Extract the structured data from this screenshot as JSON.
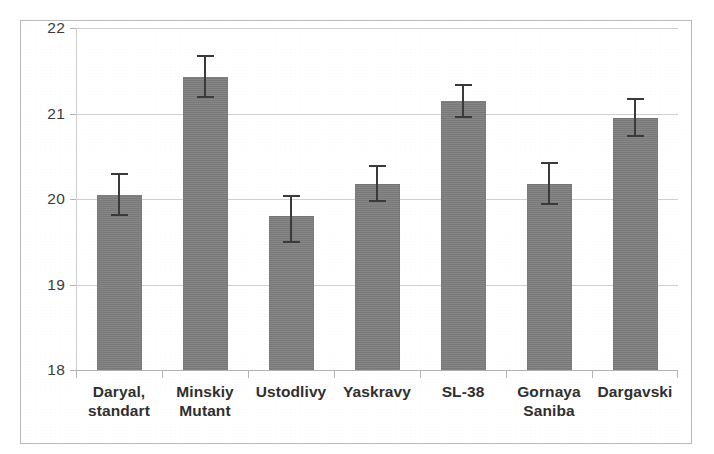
{
  "chart_data": {
    "type": "bar",
    "title": "",
    "subtitle": "",
    "xlabel": "",
    "ylabel": "",
    "categories": [
      "Daryal,\nstandart",
      "Minskiy\nMutant",
      "Ustodlivy",
      "Yaskravy",
      "SL-38",
      "Gornaya\nSaniba",
      "Dargavski"
    ],
    "values": [
      20.05,
      21.43,
      19.8,
      20.18,
      21.15,
      20.18,
      20.95
    ],
    "errors_upper": [
      0.25,
      0.25,
      0.25,
      0.22,
      0.2,
      0.25,
      0.23
    ],
    "errors_lower": [
      0.25,
      0.25,
      0.32,
      0.22,
      0.2,
      0.25,
      0.23
    ],
    "ylim": [
      18,
      22
    ],
    "yticks": [
      18,
      19,
      20,
      21,
      22
    ],
    "ytick_labels": [
      "18",
      "19",
      "20",
      "21",
      "22"
    ],
    "grid": true,
    "legend": "none",
    "bar_color": "#808080",
    "error_color": "#3a3a3a",
    "gridline_color": "#cfcfcf",
    "frame_color": "#b9b9b9",
    "background": "#ffffff"
  }
}
